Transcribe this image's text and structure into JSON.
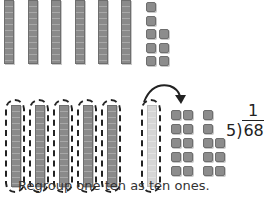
{
  "diagram": {
    "type": "base-ten-blocks-division",
    "top_model": {
      "tens_rods": 6,
      "ones_cubes": 8
    },
    "bottom_model": {
      "grouped_tens": 5,
      "regrouped_ten_rod": 1,
      "ones_cubes": 18,
      "arrow": "regroup-ten-to-ones"
    },
    "division": {
      "divisor": "5",
      "dividend": "68",
      "quotient_partial": "1",
      "paren": ")"
    },
    "caption": "Regroup one ten as ten ones.",
    "colors": {
      "block": "#8a8a8a",
      "light_block": "#d6d6d6",
      "dash": "#222222",
      "text": "#333333"
    }
  }
}
